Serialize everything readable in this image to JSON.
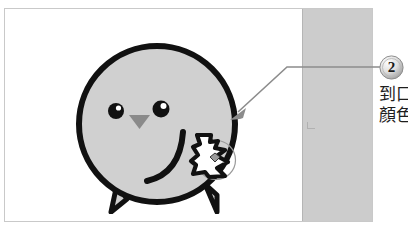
{
  "page": {
    "background_color": "#ffffff",
    "width": 408,
    "height": 233
  },
  "figure": {
    "frame_color": "#c9c9c9",
    "background_color": "#ffffff",
    "gray_band": {
      "name": "gray-column-band",
      "color": "#cccccc",
      "border_color": "#b5b5b5"
    }
  },
  "character": {
    "name": "chick-mascot",
    "body_fill": "#d0d0d0",
    "outline_color": "#111111",
    "beak_fill": "#8a8a8a",
    "eye_fill": "#111111",
    "eye_highlight": "#ffffff",
    "parts": {
      "body": "body-circle",
      "left_eye": "left-eye",
      "right_eye": "right-eye",
      "beak": "beak-triangle",
      "wing": "wing-stroke",
      "left_foot": "left-foot",
      "right_foot": "right-foot"
    }
  },
  "cursor": {
    "name": "hand-pointer-cursor",
    "fill": "#ffffff",
    "outline": "#111111",
    "highlight_ring_color": "#9a9a9a"
  },
  "callout": {
    "arrow": {
      "name": "leader-arrow",
      "color": "#8c8c8c"
    },
    "badge": {
      "label": "2",
      "fill_light": "#f2f2f2",
      "fill_dark": "#9e9e9e",
      "text_color": "#1b1b1b"
    },
    "caption": {
      "lines": [
        "到口",
        "顏色"
      ]
    }
  }
}
